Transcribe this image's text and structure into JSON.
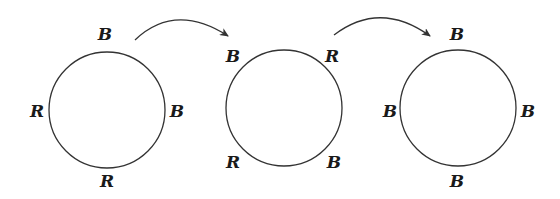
{
  "diagram": {
    "colors": {
      "stroke": "#333333",
      "text": "#1a1a1a",
      "background": "#ffffff"
    },
    "circles": [
      {
        "id": "state-1",
        "cx": 107,
        "cy": 110,
        "r": 58,
        "labels": [
          {
            "position": "top",
            "text": "B",
            "x": 105,
            "y": 40
          },
          {
            "position": "left",
            "text": "R",
            "x": 37,
            "y": 117
          },
          {
            "position": "right",
            "text": "B",
            "x": 177,
            "y": 117
          },
          {
            "position": "bottom",
            "text": "R",
            "x": 107,
            "y": 187
          }
        ]
      },
      {
        "id": "state-2",
        "cx": 284,
        "cy": 108,
        "r": 58,
        "labels": [
          {
            "position": "top-left",
            "text": "B",
            "x": 233,
            "y": 62
          },
          {
            "position": "top-right",
            "text": "R",
            "x": 332,
            "y": 62
          },
          {
            "position": "bottom-left",
            "text": "R",
            "x": 233,
            "y": 168
          },
          {
            "position": "bottom-right",
            "text": "B",
            "x": 334,
            "y": 168
          }
        ]
      },
      {
        "id": "state-3",
        "cx": 458,
        "cy": 108,
        "r": 58,
        "labels": [
          {
            "position": "top",
            "text": "B",
            "x": 457,
            "y": 40
          },
          {
            "position": "left",
            "text": "B",
            "x": 390,
            "y": 117
          },
          {
            "position": "right",
            "text": "B",
            "x": 528,
            "y": 117
          },
          {
            "position": "bottom",
            "text": "B",
            "x": 457,
            "y": 187
          }
        ]
      }
    ],
    "arrows": [
      {
        "id": "transition-1-2",
        "from": "state-1",
        "to": "state-2"
      },
      {
        "id": "transition-2-3",
        "from": "state-2",
        "to": "state-3"
      }
    ]
  }
}
